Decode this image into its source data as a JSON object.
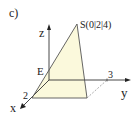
{
  "figure": {
    "part_label": "c)",
    "apex_label": "S(0|2|4)",
    "point_e_label": "E",
    "axes": {
      "x": {
        "label": "x",
        "tick": "2"
      },
      "y": {
        "label": "y",
        "tick": "3"
      },
      "z": {
        "label": "z"
      }
    },
    "colors": {
      "fill": "#fbf9dc",
      "stroke": "#555555",
      "axis": "#333333"
    }
  }
}
